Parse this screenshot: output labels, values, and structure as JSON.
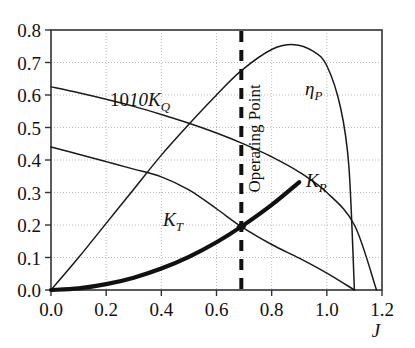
{
  "chart_data": {
    "type": "line",
    "title": "",
    "subtitle": "",
    "xlabel": "J",
    "ylabel": "",
    "xlim": [
      0.0,
      1.2
    ],
    "ylim": [
      0.0,
      0.8
    ],
    "grid": true,
    "legend_position": "inline-curve-labels",
    "xticks": [
      "0.0",
      "0.2",
      "0.4",
      "0.6",
      "0.8",
      "1.0",
      "1.2"
    ],
    "xtick_values": [
      0.0,
      0.2,
      0.4,
      0.6,
      0.8,
      1.0,
      1.2
    ],
    "yticks": [
      "0.0",
      "0.1",
      "0.2",
      "0.3",
      "0.4",
      "0.5",
      "0.6",
      "0.7",
      "0.8"
    ],
    "ytick_values": [
      0.0,
      0.1,
      0.2,
      0.3,
      0.4,
      0.5,
      0.6,
      0.7,
      0.8
    ],
    "series": [
      {
        "name": "10K_Q",
        "label": "10K",
        "label_sub": "Q",
        "label_prefix": "10",
        "style": "thin-solid",
        "color": "#1a1a1a",
        "x": [
          0.0,
          0.1,
          0.2,
          0.3,
          0.4,
          0.5,
          0.6,
          0.7,
          0.8,
          0.9,
          1.0,
          1.1,
          1.18
        ],
        "y": [
          0.625,
          0.607,
          0.587,
          0.565,
          0.54,
          0.513,
          0.483,
          0.449,
          0.41,
          0.363,
          0.3,
          0.2,
          0.0
        ]
      },
      {
        "name": "K_T",
        "label": "K",
        "label_sub": "T",
        "style": "thin-solid",
        "color": "#1a1a1a",
        "x": [
          0.0,
          0.1,
          0.2,
          0.3,
          0.4,
          0.5,
          0.6,
          0.69,
          0.8,
          0.9,
          1.0,
          1.1
        ],
        "y": [
          0.44,
          0.418,
          0.395,
          0.372,
          0.348,
          0.308,
          0.25,
          0.195,
          0.14,
          0.098,
          0.052,
          0.0
        ]
      },
      {
        "name": "eta_P",
        "label": "η",
        "label_sub": "P",
        "style": "thin-solid",
        "color": "#1a1a1a",
        "x": [
          0.0,
          0.1,
          0.2,
          0.3,
          0.4,
          0.5,
          0.6,
          0.69,
          0.8,
          0.88,
          0.95,
          1.0,
          1.05,
          1.08,
          1.1
        ],
        "y": [
          0.0,
          0.1,
          0.205,
          0.31,
          0.415,
          0.51,
          0.6,
          0.675,
          0.74,
          0.755,
          0.735,
          0.69,
          0.56,
          0.38,
          0.0
        ]
      },
      {
        "name": "K_R",
        "label": "K",
        "label_sub": "R",
        "style": "thick-solid",
        "color": "#111111",
        "x": [
          0.0,
          0.1,
          0.2,
          0.3,
          0.4,
          0.5,
          0.6,
          0.69,
          0.8,
          0.9
        ],
        "y": [
          0.0,
          0.005,
          0.018,
          0.038,
          0.066,
          0.102,
          0.147,
          0.195,
          0.262,
          0.332
        ]
      }
    ],
    "annotations": [
      {
        "name": "operating-point-line",
        "text": "Operating Point",
        "type": "vertical-dashed-line",
        "x": 0.69,
        "orientation": "vertical-text-bottom-to-top"
      },
      {
        "name": "operating-point-marker",
        "type": "marker",
        "x": 0.69,
        "y": 0.195
      }
    ],
    "curve_label_positions": [
      {
        "name": "10K_Q",
        "x": 0.2,
        "y": 0.615
      },
      {
        "name": "K_T",
        "x": 0.46,
        "y": 0.245
      },
      {
        "name": "eta_P",
        "x": 0.9,
        "y": 0.62
      },
      {
        "name": "K_R",
        "x": 0.905,
        "y": 0.365
      }
    ]
  },
  "colors": {
    "axis": "#333333",
    "grid": "#b9b9b9",
    "curve": "#1a1a1a",
    "curve_bold": "#111111",
    "background": "#ffffff"
  }
}
